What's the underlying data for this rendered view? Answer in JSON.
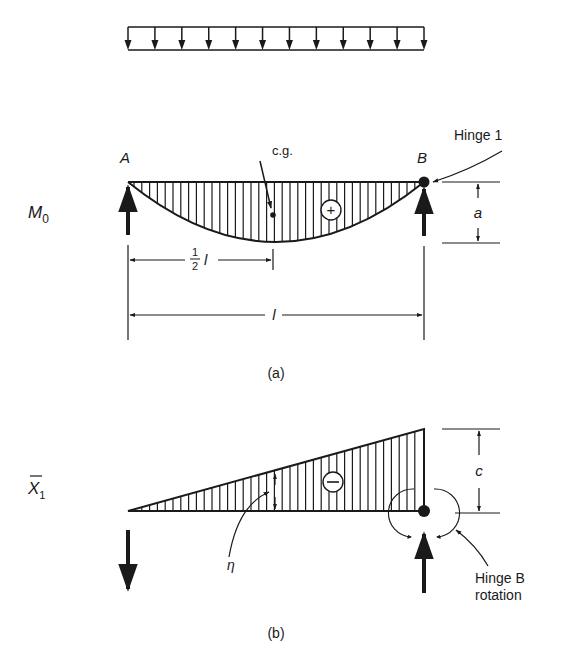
{
  "figure": {
    "load": {
      "type": "uniform distributed load",
      "arrow_count": 12
    },
    "panel_a": {
      "caption": "(a)",
      "diagram_label_main": "M",
      "diagram_label_sub": "0",
      "support_left": "A",
      "support_right": "B",
      "cg_label": "c.g.",
      "sign": "+",
      "hinge_label": "Hinge 1",
      "dim_height": "a",
      "dim_half_num": "1",
      "dim_half_den": "2",
      "dim_half_var": "l",
      "dim_span": "l"
    },
    "panel_b": {
      "caption": "(b)",
      "diagram_label_main": "X",
      "diagram_label_sub": "1",
      "sign": "−",
      "ordinate_label": "η",
      "dim_height": "c",
      "hinge_label_line1": "Hinge B",
      "hinge_label_line2": "rotation"
    }
  },
  "colors": {
    "ink": "#1a1a1a",
    "background": "#ffffff"
  }
}
